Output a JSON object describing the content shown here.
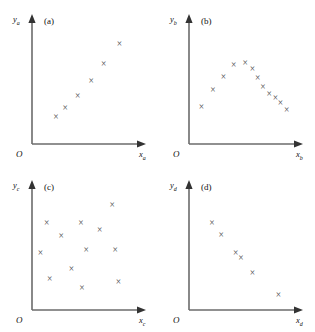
{
  "figure": {
    "origin_label": "O",
    "panels": [
      {
        "id": "a",
        "tag": "(a)",
        "ylabel": "y",
        "ylabel_sub": "a",
        "xlabel": "x",
        "xlabel_sub": "a",
        "marker": "×",
        "description": "strong positive linear relationship"
      },
      {
        "id": "b",
        "tag": "(b)",
        "ylabel": "y",
        "ylabel_sub": "b",
        "xlabel": "x",
        "xlabel_sub": "b",
        "marker": "×",
        "description": "curvilinear inverted-U relationship"
      },
      {
        "id": "c",
        "tag": "(c)",
        "ylabel": "y",
        "ylabel_sub": "c",
        "xlabel": "x",
        "xlabel_sub": "c",
        "marker": "×",
        "description": "no relationship, random scatter"
      },
      {
        "id": "d",
        "tag": "(d)",
        "ylabel": "y",
        "ylabel_sub": "d",
        "xlabel": "x",
        "xlabel_sub": "d",
        "marker": "×",
        "description": "negative relationship"
      }
    ]
  },
  "chart_data": [
    {
      "type": "scatter",
      "title": "(a)",
      "xlabel": "x_a",
      "ylabel": "y_a",
      "xlim": [
        0,
        100
      ],
      "ylim": [
        0,
        100
      ],
      "grid": false,
      "legend": "none",
      "marker": "x",
      "points": [
        {
          "x": 23,
          "y": 22
        },
        {
          "x": 32,
          "y": 30
        },
        {
          "x": 44,
          "y": 40
        },
        {
          "x": 57,
          "y": 53
        },
        {
          "x": 69,
          "y": 67
        },
        {
          "x": 84,
          "y": 84
        }
      ]
    },
    {
      "type": "scatter",
      "title": "(b)",
      "xlabel": "x_b",
      "ylabel": "y_b",
      "xlim": [
        0,
        100
      ],
      "ylim": [
        0,
        100
      ],
      "grid": false,
      "legend": "none",
      "marker": "x",
      "points": [
        {
          "x": 12,
          "y": 31
        },
        {
          "x": 23,
          "y": 45
        },
        {
          "x": 33,
          "y": 56
        },
        {
          "x": 43,
          "y": 66
        },
        {
          "x": 54,
          "y": 68
        },
        {
          "x": 61,
          "y": 63
        },
        {
          "x": 66,
          "y": 55
        },
        {
          "x": 71,
          "y": 48
        },
        {
          "x": 77,
          "y": 42
        },
        {
          "x": 83,
          "y": 38
        },
        {
          "x": 88,
          "y": 34
        },
        {
          "x": 94,
          "y": 28
        }
      ]
    },
    {
      "type": "scatter",
      "title": "(c)",
      "xlabel": "x_c",
      "ylabel": "y_c",
      "xlim": [
        0,
        100
      ],
      "ylim": [
        0,
        100
      ],
      "grid": false,
      "legend": "none",
      "marker": "x",
      "points": [
        {
          "x": 14,
          "y": 73
        },
        {
          "x": 8,
          "y": 48
        },
        {
          "x": 17,
          "y": 26
        },
        {
          "x": 28,
          "y": 62
        },
        {
          "x": 38,
          "y": 34
        },
        {
          "x": 47,
          "y": 73
        },
        {
          "x": 48,
          "y": 18
        },
        {
          "x": 52,
          "y": 50
        },
        {
          "x": 65,
          "y": 67
        },
        {
          "x": 77,
          "y": 88
        },
        {
          "x": 80,
          "y": 50
        },
        {
          "x": 83,
          "y": 23
        }
      ]
    },
    {
      "type": "scatter",
      "title": "(d)",
      "xlabel": "x_d",
      "ylabel": "y_d",
      "xlim": [
        0,
        100
      ],
      "ylim": [
        0,
        100
      ],
      "grid": false,
      "legend": "none",
      "marker": "x",
      "points": [
        {
          "x": 22,
          "y": 73
        },
        {
          "x": 31,
          "y": 63
        },
        {
          "x": 45,
          "y": 48
        },
        {
          "x": 50,
          "y": 43
        },
        {
          "x": 61,
          "y": 31
        },
        {
          "x": 86,
          "y": 12
        }
      ]
    }
  ]
}
